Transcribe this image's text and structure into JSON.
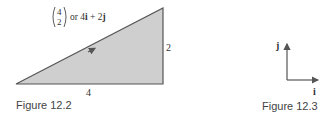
{
  "figure_12_2": {
    "caption": "Figure 12.2",
    "vector_column_top": "4",
    "vector_column_bottom": "2",
    "vector_text_or": "or 4",
    "vector_i": "i",
    "vector_plus": " + 2",
    "vector_j": "j",
    "base_label": "4",
    "height_label": "2",
    "fill_color": "#cfcfcf",
    "stroke_color": "#555555"
  },
  "figure_12_3": {
    "caption": "Figure 12.3",
    "i_label": "i",
    "j_label": "j",
    "axis_color": "#555555"
  }
}
